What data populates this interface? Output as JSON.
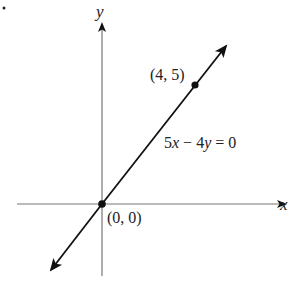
{
  "diagram": {
    "type": "coordinate-plane-line",
    "axes": {
      "x_label": "x",
      "y_label": "y"
    },
    "line": {
      "equation": "5x − 4y = 0",
      "equation_parts": {
        "a": "5",
        "x": "x",
        "op": " − ",
        "b": "4",
        "y": "y",
        "rhs": " = 0"
      },
      "direction": "both arrows"
    },
    "points": [
      {
        "label": "(4, 5)",
        "x": 4,
        "y": 5
      },
      {
        "label": "(0, 0)",
        "x": 0,
        "y": 0
      }
    ],
    "colors": {
      "axis": "#777777",
      "line": "#111111",
      "text": "#222222"
    }
  }
}
